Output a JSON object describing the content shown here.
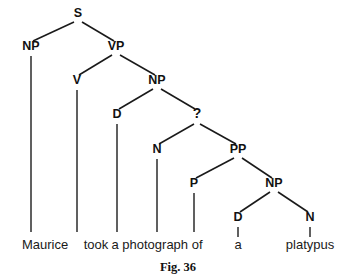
{
  "figure": {
    "caption": "Fig. 36",
    "caption_x": 178,
    "caption_y": 271,
    "width": 349,
    "height": 279,
    "background_color": "#ffffff",
    "ink_color": "#1a1a1a",
    "sentence": "Maurice took a photograph of a platypus"
  },
  "nodes": [
    {
      "id": "s",
      "label": "S",
      "x": 78,
      "y": 17,
      "kind": "phrase"
    },
    {
      "id": "np1",
      "label": "NP",
      "x": 31,
      "y": 50,
      "kind": "phrase"
    },
    {
      "id": "vp",
      "label": "VP",
      "x": 116,
      "y": 50,
      "kind": "phrase"
    },
    {
      "id": "v",
      "label": "V",
      "x": 77,
      "y": 84,
      "kind": "phrase"
    },
    {
      "id": "np2",
      "label": "NP",
      "x": 157,
      "y": 84,
      "kind": "phrase"
    },
    {
      "id": "d1",
      "label": "D",
      "x": 117,
      "y": 118,
      "kind": "phrase"
    },
    {
      "id": "qnode",
      "label": "?",
      "x": 197,
      "y": 118,
      "kind": "unknown"
    },
    {
      "id": "n1",
      "label": "N",
      "x": 157,
      "y": 153,
      "kind": "phrase"
    },
    {
      "id": "pp",
      "label": "PP",
      "x": 238,
      "y": 153,
      "kind": "phrase"
    },
    {
      "id": "p",
      "label": "P",
      "x": 194,
      "y": 187,
      "kind": "phrase"
    },
    {
      "id": "np3",
      "label": "NP",
      "x": 274,
      "y": 187,
      "kind": "phrase"
    },
    {
      "id": "d2",
      "label": "D",
      "x": 238,
      "y": 221,
      "kind": "phrase"
    },
    {
      "id": "n2",
      "label": "N",
      "x": 310,
      "y": 221,
      "kind": "phrase"
    }
  ],
  "edges": [
    {
      "from": "s",
      "to": "np1",
      "x1": 74,
      "y1": 22,
      "x2": 33,
      "y2": 41
    },
    {
      "from": "s",
      "to": "vp",
      "x1": 82,
      "y1": 22,
      "x2": 114,
      "y2": 41
    },
    {
      "from": "vp",
      "to": "v",
      "x1": 112,
      "y1": 55,
      "x2": 79,
      "y2": 75
    },
    {
      "from": "vp",
      "to": "np2",
      "x1": 120,
      "y1": 55,
      "x2": 155,
      "y2": 75
    },
    {
      "from": "np2",
      "to": "d1",
      "x1": 153,
      "y1": 89,
      "x2": 119,
      "y2": 109
    },
    {
      "from": "np2",
      "to": "qnode",
      "x1": 161,
      "y1": 89,
      "x2": 195,
      "y2": 109
    },
    {
      "from": "qnode",
      "to": "n1",
      "x1": 194,
      "y1": 124,
      "x2": 159,
      "y2": 144
    },
    {
      "from": "qnode",
      "to": "pp",
      "x1": 200,
      "y1": 124,
      "x2": 236,
      "y2": 144
    },
    {
      "from": "pp",
      "to": "p",
      "x1": 234,
      "y1": 158,
      "x2": 196,
      "y2": 178
    },
    {
      "from": "pp",
      "to": "np3",
      "x1": 242,
      "y1": 158,
      "x2": 272,
      "y2": 178
    },
    {
      "from": "np3",
      "to": "d2",
      "x1": 270,
      "y1": 192,
      "x2": 240,
      "y2": 212
    },
    {
      "from": "np3",
      "to": "n2",
      "x1": 278,
      "y1": 192,
      "x2": 308,
      "y2": 212
    }
  ],
  "stems": [
    {
      "node": "np1",
      "word": "maurice",
      "x": 31,
      "y1": 56,
      "y2": 232
    },
    {
      "node": "v",
      "word": "took",
      "x": 77,
      "y1": 90,
      "y2": 232
    },
    {
      "node": "d1",
      "word": "a1",
      "x": 117,
      "y1": 124,
      "y2": 232
    },
    {
      "node": "n1",
      "word": "photograph",
      "x": 157,
      "y1": 159,
      "y2": 232
    },
    {
      "node": "p",
      "word": "of",
      "x": 194,
      "y1": 193,
      "y2": 232
    },
    {
      "node": "d2",
      "word": "a2",
      "x": 238,
      "y1": 227,
      "y2": 237
    },
    {
      "node": "n2",
      "word": "platypus",
      "x": 310,
      "y1": 227,
      "y2": 237
    }
  ],
  "leaves": [
    {
      "id": "maurice",
      "label": "Maurice",
      "x": 45,
      "y": 249
    },
    {
      "id": "took",
      "label": "took",
      "x": 96,
      "y": 249
    },
    {
      "id": "photograph",
      "label": "a photograph of",
      "x": 157,
      "y": 249
    },
    {
      "id": "a2",
      "label": "a",
      "x": 238,
      "y": 249
    },
    {
      "id": "platypus",
      "label": "platypus",
      "x": 310,
      "y": 249
    }
  ]
}
